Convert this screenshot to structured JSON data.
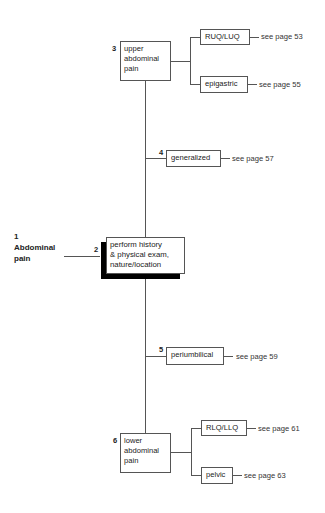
{
  "start": {
    "number": "1",
    "label_line1": "Abdominal",
    "label_line2": "pain"
  },
  "nodes": {
    "history": {
      "number": "2",
      "lines": [
        "perform history",
        "& physical exam,",
        "nature/location"
      ]
    },
    "upper": {
      "number": "3",
      "lines": [
        "upper",
        "abdominal",
        "pain"
      ]
    },
    "generalized": {
      "number": "4",
      "label": "generalized",
      "ref": "see page 57"
    },
    "periumbilical": {
      "number": "5",
      "label": "periumbilical",
      "ref": "see page 59"
    },
    "lower": {
      "number": "6",
      "lines": [
        "lower",
        "abdominal",
        "pain"
      ]
    },
    "ruq_luq": {
      "label": "RUQ/LUQ",
      "ref": "see page 53"
    },
    "epigastric": {
      "label": "epigastric",
      "ref": "see page 55"
    },
    "rlq_llq": {
      "label": "RLQ/LLQ",
      "ref": "see page 61"
    },
    "pelvic": {
      "label": "pelvic",
      "ref": "see page 63"
    }
  }
}
